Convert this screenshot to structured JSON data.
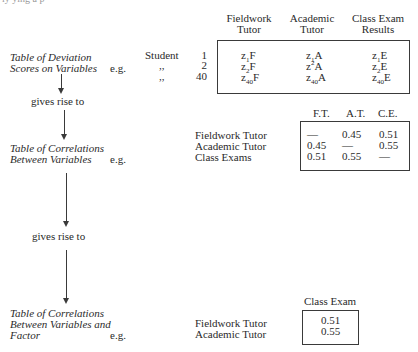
{
  "top_cutoff_text": "ly ying   a      p",
  "stage1": {
    "label_lines": [
      "Table of Deviation",
      "Scores on Variables"
    ],
    "eg": "e.g.",
    "columns": [
      {
        "line1": "Fieldwork",
        "line2": "Tutor"
      },
      {
        "line1": "Academic",
        "line2": "Tutor"
      },
      {
        "line1": "Class Exam",
        "line2": "Results"
      }
    ],
    "rows": [
      {
        "label": "Student",
        "index": "1",
        "cells": [
          {
            "base": "z",
            "sub": "1",
            "sup": "",
            "var": "F"
          },
          {
            "base": "z",
            "sub": "1",
            "sup": "",
            "var": "A"
          },
          {
            "base": "z",
            "sub": "1",
            "sup": "",
            "var": "E"
          }
        ]
      },
      {
        "label": ",,",
        "index": "2",
        "cells": [
          {
            "base": "z",
            "sub": "2",
            "sup": "",
            "var": "F"
          },
          {
            "base": "z",
            "sub": "",
            "sup": "2",
            "var": "A"
          },
          {
            "base": "z",
            "sub": "2",
            "sup": "",
            "var": "E"
          }
        ]
      },
      {
        "label": ",,",
        "index": "40",
        "cells": [
          {
            "base": "z",
            "sub": "40",
            "sup": "",
            "var": "F"
          },
          {
            "base": "z",
            "sub": "40",
            "sup": "",
            "var": "A"
          },
          {
            "base": "z",
            "sub": "40",
            "sup": "",
            "var": "E"
          }
        ]
      }
    ]
  },
  "connector1": "gives rise to",
  "stage2": {
    "label_lines": [
      "Table of Correlations",
      "Between Variables"
    ],
    "eg": "e.g.",
    "col_headers": [
      "F.T.",
      "A.T.",
      "C.E."
    ],
    "rows": [
      {
        "label": "Fieldwork Tutor",
        "values": [
          "—",
          "0.45",
          "0.51"
        ]
      },
      {
        "label": "Academic Tutor",
        "values": [
          "0.45",
          "—",
          "0.55"
        ]
      },
      {
        "label": "Class Exams",
        "values": [
          "0.51",
          "0.55",
          "—"
        ]
      }
    ]
  },
  "connector2": "gives rise to",
  "stage3": {
    "label_lines": [
      "Table of Correlations",
      "Between Variables and",
      "Factor"
    ],
    "eg": "e.g.",
    "col_header": "Class Exam",
    "rows": [
      {
        "label": "Fieldwork Tutor",
        "value": "0.51"
      },
      {
        "label": "Academic Tutor",
        "value": "0.55"
      }
    ]
  }
}
